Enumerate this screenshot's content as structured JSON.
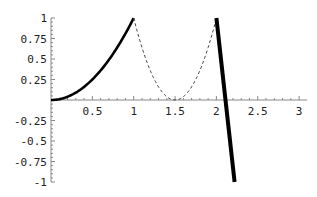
{
  "chart_data": {
    "type": "line",
    "title": "",
    "xlabel": "",
    "ylabel": "",
    "xlim": [
      0,
      3
    ],
    "ylim": [
      -1,
      1
    ],
    "grid": false,
    "legend": null,
    "x_ticks": [
      0.5,
      1,
      1.5,
      2,
      2.5,
      3
    ],
    "x_tick_labels": [
      "0.5",
      "1",
      "1.5",
      "2",
      "2.5",
      "3"
    ],
    "y_ticks": [
      1,
      0.75,
      0.5,
      0.25,
      -0.25,
      -0.5,
      -0.75,
      -1
    ],
    "y_tick_labels": [
      "1",
      "0.75",
      "0.5",
      "0.25",
      "-0.25",
      "-0.5",
      "-0.75",
      "-1"
    ],
    "series": [
      {
        "name": "segment-1",
        "style": "solid",
        "weight": "thick",
        "color": "#000000",
        "x": [
          0,
          0.1,
          0.2,
          0.3,
          0.4,
          0.5,
          0.6,
          0.7,
          0.8,
          0.9,
          1.0
        ],
        "y": [
          0,
          0.01,
          0.04,
          0.09,
          0.16,
          0.25,
          0.36,
          0.49,
          0.64,
          0.81,
          1.0
        ]
      },
      {
        "name": "segment-2",
        "style": "dashed",
        "weight": "thin",
        "color": "#000000",
        "x": [
          1.0,
          1.1,
          1.2,
          1.3,
          1.4,
          1.5,
          1.6,
          1.7,
          1.8,
          1.9,
          2.0
        ],
        "y": [
          1.0,
          0.64,
          0.36,
          0.16,
          0.04,
          0,
          0.04,
          0.16,
          0.36,
          0.64,
          1.0
        ]
      },
      {
        "name": "segment-3",
        "style": "solid",
        "weight": "very-thick",
        "color": "#000000",
        "x": [
          2.0,
          2.22
        ],
        "y": [
          1.0,
          -1.0
        ]
      }
    ]
  }
}
